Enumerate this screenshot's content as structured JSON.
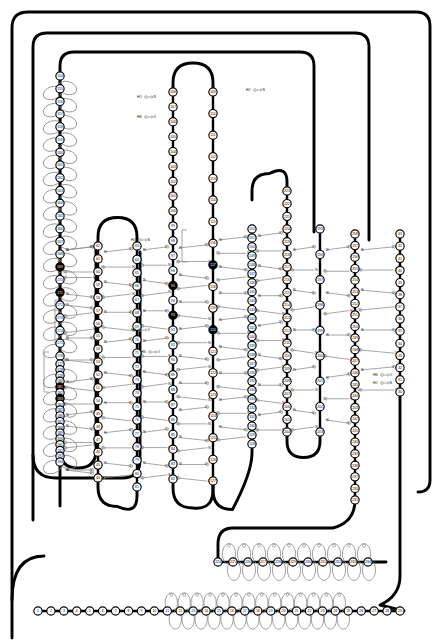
{
  "figure": {
    "kind": "HERA-style residue wiring diagram",
    "background_color": "#ffffff",
    "ink_color": "#000000",
    "hbond_color": "#8a8a8a",
    "residue_fill": "#ffffff",
    "highlight_fill": "#000000",
    "residue_range": {
      "first": 1,
      "last": 258
    },
    "donor_label": "N",
    "acceptor_label": "O"
  },
  "annotations": {
    "terminal_marks": [
      {
        "id": "ho-n-top",
        "text_left": "HO",
        "arrow": "→",
        "text_right": "N"
      },
      {
        "id": "hn-o-top",
        "text_left": "HN",
        "arrow": "→",
        "text_right": "O"
      },
      {
        "id": "hn-o-right",
        "text_left": "HN",
        "arrow": "→",
        "text_right": "O"
      },
      {
        "id": "ho-n-right",
        "text_left": "HO",
        "arrow": "→",
        "text_right": "N"
      },
      {
        "id": "ho-n-mid",
        "text_left": "HO",
        "arrow": "→",
        "text_right": "N"
      },
      {
        "id": "hn-o-mid",
        "text_left": "HN",
        "arrow": "→",
        "text_right": "O"
      },
      {
        "id": "hn-o-low",
        "text_left": "HN",
        "arrow": "→",
        "text_right": "O"
      },
      {
        "id": "ho-n-low",
        "text_left": "HO",
        "arrow": "→",
        "text_right": "N"
      }
    ],
    "loose_labels": [
      "N",
      "O",
      "HN",
      "HO"
    ]
  },
  "strands": [
    {
      "id": "s-154-176",
      "label": "α-helix 154-176",
      "x": 60,
      "y_top": 76,
      "y_bot": 356,
      "dir": "down",
      "start": 154,
      "end": 176,
      "kind": "helix",
      "helix_side": "right"
    },
    {
      "id": "s-177-194",
      "label": "β-strand 177-194",
      "x": 60,
      "y_top": 364,
      "y_bot": 462,
      "dir": "down",
      "start": 177,
      "end": 194,
      "kind": "helix-tail",
      "helix_side": "right"
    },
    {
      "id": "s-62-44",
      "label": "β-strand 62-44",
      "x": 98,
      "y_top": 246,
      "y_bot": 478,
      "dir": "down",
      "start": 62,
      "end": 44,
      "kind": "strand"
    },
    {
      "id": "s-63-81",
      "label": "β-strand 63-81",
      "x": 137,
      "y_top": 246,
      "y_bot": 487,
      "dir": "down",
      "start": 63,
      "end": 81,
      "kind": "strand"
    },
    {
      "id": "s-108-82",
      "label": "β-strand 108-82",
      "x": 173,
      "y_top": 92,
      "y_bot": 479,
      "dir": "down",
      "start": 108,
      "end": 82,
      "kind": "strand"
    },
    {
      "id": "s-109-127",
      "label": "β-strand 109-127",
      "x": 213,
      "y_top": 92,
      "y_bot": 481,
      "dir": "down",
      "start": 109,
      "end": 127,
      "kind": "strand"
    },
    {
      "id": "s-152-128",
      "label": "β-strand 152-128",
      "x": 252,
      "y_top": 229,
      "y_bot": 444,
      "dir": "down",
      "start": 152,
      "end": 128,
      "kind": "strand"
    },
    {
      "id": "s-223-204",
      "label": "β-strand 223-204",
      "x": 287,
      "y_top": 191,
      "y_bot": 432,
      "dir": "down",
      "start": 223,
      "end": 204,
      "kind": "strand"
    },
    {
      "id": "s-195-203",
      "label": "β-strand 195-203",
      "x": 320,
      "y_top": 229,
      "y_bot": 432,
      "dir": "down",
      "start": 195,
      "end": 203,
      "kind": "strand"
    },
    {
      "id": "s-258-235",
      "label": "β-strand 258-235",
      "x": 355,
      "y_top": 234,
      "y_bot": 500,
      "dir": "down",
      "start": 258,
      "end": 235,
      "kind": "strand"
    },
    {
      "id": "s-43-30",
      "label": "β-strand 43-30",
      "x": 400,
      "y_top": 234,
      "y_bot": 392,
      "dir": "down",
      "start": 43,
      "end": 30,
      "kind": "strand"
    },
    {
      "id": "h-224-234",
      "label": "α-helix 224-234",
      "y": 562,
      "x_left": 218,
      "x_right": 368,
      "start": 224,
      "end": 234,
      "kind": "helix-horizontal"
    },
    {
      "id": "ch-1-29",
      "label": "N-terminal chain 1-29",
      "y": 611,
      "x_left": 38,
      "x_right": 400,
      "start": 1,
      "end": 29,
      "kind": "chain-horizontal"
    }
  ],
  "highlighted_residues": [
    93,
    95,
    117,
    120,
    169,
    171,
    181,
    183
  ],
  "loops": [
    {
      "id": "outer-loop-1",
      "desc": "outermost rounded connector, left-top to right"
    },
    {
      "id": "outer-loop-2",
      "desc": "second rounded connector"
    },
    {
      "id": "outer-loop-3",
      "desc": "third rounded connector"
    },
    {
      "id": "hairpin-108-109",
      "desc": "beta hairpin turn at top of 108/109"
    },
    {
      "id": "hairpin-62-63",
      "desc": "beta hairpin turn above 62/63"
    },
    {
      "id": "hairpin-223",
      "desc": "hairpin turn above strand 223"
    },
    {
      "id": "uturn-194",
      "desc": "U-turn below residue 194"
    },
    {
      "id": "uturn-44-63",
      "desc": "U-turn joining 44 to 63"
    },
    {
      "id": "uturn-81-82",
      "desc": "U-turn joining 81 to 82"
    },
    {
      "id": "uturn-127-128",
      "desc": "U-turn joining 127 to 128"
    },
    {
      "id": "uturn-203-204",
      "desc": "U-turn joining 203 to 204"
    },
    {
      "id": "turn-235",
      "desc": "turn from strand 235 into helix 224-234"
    }
  ],
  "legend": {
    "residue_shape": "circle with residue sequence number",
    "thick_black_line": "polypeptide backbone",
    "thin_grey_line": "hydrogen bond (N→O)",
    "filled_circle": "highlighted / buried residue"
  }
}
